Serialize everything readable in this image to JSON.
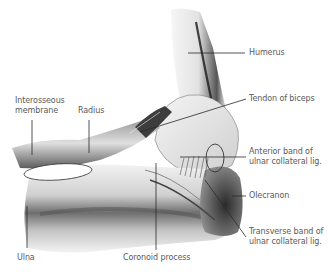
{
  "figure": {
    "colors": {
      "background": "#ffffff",
      "label_text": "#5a5a5a",
      "leader_line": "#2a2a2a",
      "bone_light": "#ececec",
      "bone_mid": "#bdbdbd",
      "bone_dark": "#3a3a3a"
    },
    "labels": {
      "humerus": "Humerus",
      "tendon_of_biceps": "Tendon of biceps",
      "interosseous_line1": "Interosseous",
      "interosseous_line2": "membrane",
      "radius": "Radius",
      "anterior_band_line1": "Anterior band of",
      "anterior_band_line2": "ulnar collateral lig.",
      "olecranon": "Olecranon",
      "transverse_band_line1": "Transverse band of",
      "transverse_band_line2": "ulnar collateral lig.",
      "ulna": "Ulna",
      "coronoid_process": "Coronoid process"
    }
  }
}
